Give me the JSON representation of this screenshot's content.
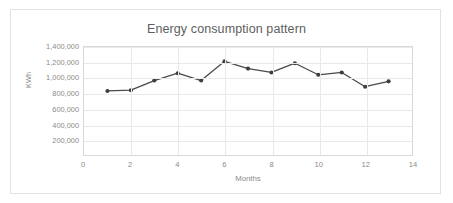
{
  "chart_data": {
    "type": "line",
    "title": "Energy consumption pattern",
    "xlabel": "Months",
    "ylabel": "KWh",
    "x": [
      1,
      2,
      3,
      4,
      5,
      6,
      7,
      8,
      9,
      10,
      11,
      12,
      13
    ],
    "values": [
      830000,
      840000,
      965000,
      1060000,
      965000,
      1215000,
      1120000,
      1070000,
      1190000,
      1040000,
      1070000,
      885000,
      955000
    ],
    "series": [
      {
        "name": "Energy consumption",
        "values": [
          830000,
          840000,
          965000,
          1060000,
          965000,
          1215000,
          1120000,
          1070000,
          1190000,
          1040000,
          1070000,
          885000,
          955000
        ]
      }
    ],
    "xlim": [
      0,
      14
    ],
    "ylim": [
      0,
      1400000
    ],
    "xticks": [
      0,
      2,
      4,
      6,
      8,
      10,
      12,
      14
    ],
    "xtick_labels": [
      "0",
      "2",
      "4",
      "6",
      "8",
      "10",
      "12",
      "14"
    ],
    "yticks": [
      200000,
      400000,
      600000,
      800000,
      1000000,
      1200000,
      1400000
    ],
    "ytick_labels": [
      "200,000",
      "400,000",
      "600,000",
      "800,000",
      "1,000,000",
      "1,200,000",
      "1,400,000"
    ],
    "grid": "horizontal-and-vertical",
    "legend": "none",
    "line_color": "#4a4a4a",
    "marker_color": "#3f3f3f",
    "marker": "circle",
    "gridline_color": "#e9e9e9",
    "plot_border_color": "#d9d9d9",
    "text_color": "#8a8a8a",
    "title_color": "#5e5e5e",
    "background_color": "#ffffff"
  }
}
